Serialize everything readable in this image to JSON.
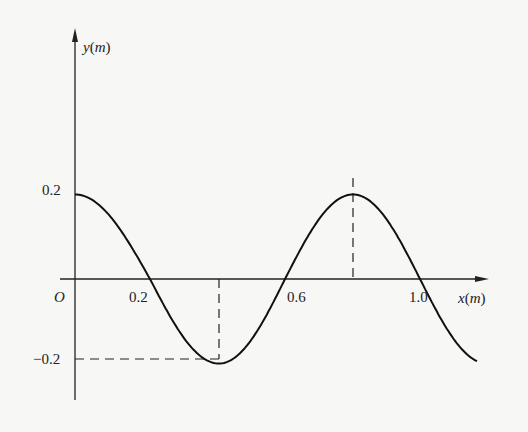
{
  "chart_data": {
    "type": "line",
    "title": "",
    "xlabel": "x(m)",
    "ylabel": "y(m)",
    "origin_label": "O",
    "x_ticks": [
      "0.2",
      "0.6",
      "1.0"
    ],
    "y_ticks": [
      "0.2",
      "-0.2"
    ],
    "grid": false,
    "legend": null,
    "series": [
      {
        "name": "wave",
        "function": "y = 0.2 cos(2πx / 0.8)",
        "amplitude": 0.2,
        "wavelength": 0.8,
        "x": [
          0.0,
          0.2,
          0.4,
          0.6,
          0.8,
          1.0,
          1.2
        ],
        "values": [
          0.2,
          0.0,
          -0.2,
          0.0,
          0.2,
          0.0,
          -0.17
        ]
      }
    ],
    "annotations": [
      {
        "type": "dashed-line",
        "description": "horizontal dashed line from y-axis at -0.2 to trough"
      },
      {
        "type": "dashed-line",
        "description": "vertical dashed line from x-axis down to trough"
      },
      {
        "type": "dashed-line",
        "description": "vertical dashed line from x-axis up to crest"
      }
    ],
    "xlim": [
      0,
      1.2
    ],
    "ylim": [
      -0.25,
      0.35
    ]
  },
  "labels": {
    "y_axis": "y(m)",
    "x_axis": "x(m)",
    "origin": "O",
    "y_pos": "0.2",
    "y_neg": "−0.2",
    "x1": "0.2",
    "x2": "0.6",
    "x3": "1.0"
  }
}
